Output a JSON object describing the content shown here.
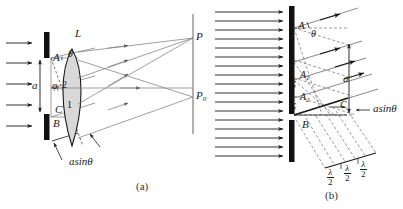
{
  "figure": {
    "background": "#ffffff",
    "ink": "#1a1a1a",
    "gray": "#888888",
    "lens_fill": "#d9d9d9",
    "width": 403,
    "height": 209
  },
  "panel_a": {
    "caption": "(a)",
    "labels": {
      "lens": "L",
      "slit_top": "A",
      "slit_bottom": "B",
      "point_c": "C",
      "slit_width": "a",
      "theta": "θ",
      "phi": "φ",
      "ray2": "2",
      "ray1": "1",
      "screen_point_p": "P",
      "screen_point_p0": "P",
      "screen_point_p0_sub": "0",
      "path_difference": "a",
      "path_difference_fn": "sin",
      "path_difference_angle": "θ"
    },
    "incoming_wave_arrows": 5,
    "elements": [
      "plane-wave-arrows",
      "upper-slit-jaw",
      "lower-slit-jaw",
      "slit-width-dimension",
      "converging-lens",
      "optic-axis",
      "diffracted-ray-bundle",
      "focal-screen",
      "path-difference-dimension"
    ]
  },
  "panel_b": {
    "caption": "(b)",
    "labels": {
      "slit_top": "A",
      "slit_bottom": "B",
      "zone_point_c": "C",
      "zone_a1": "A",
      "zone_a1_sub": "1",
      "zone_a2": "A",
      "zone_a2_sub": "2",
      "zone_g1": "G",
      "zone_g2": "G",
      "slit_width": "a",
      "theta": "θ",
      "path_difference": "a",
      "path_difference_fn": "sin",
      "path_difference_angle": "θ",
      "half_wave_num": "λ",
      "half_wave_den": "2"
    },
    "half_wave_zone_count": 3,
    "half_wave_labels": [
      "λ/2",
      "λ/2",
      "λ/2"
    ],
    "incoming_wave_arrows": 17,
    "elements": [
      "plane-wave-arrows",
      "opaque-screen",
      "slit-aperture",
      "diffracted-ray-bundle",
      "wavefront-dashed-lines",
      "slit-width-dimension",
      "path-difference-dimension",
      "half-wave-zone-brackets"
    ]
  }
}
